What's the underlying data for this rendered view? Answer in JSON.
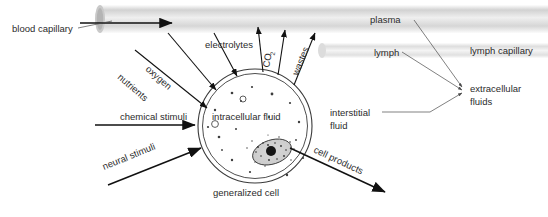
{
  "figure": {
    "background_color": "#ffffff",
    "text_color": "#2b2b2b",
    "arrow_color": "#111111",
    "leader_color": "#4a4a4a",
    "cell_fill_color": "#e3e3e3",
    "cell_outline_color": "#3a3a3a",
    "tube_color": "#d9d9d9"
  },
  "labels": {
    "blood_capillary": "blood capillary",
    "lymph_capillary": "lymph capillary",
    "plasma": "plasma",
    "lymph": "lymph",
    "extracellular_fluids_line1": "extracellular",
    "extracellular_fluids_line2": "fluids",
    "interstitial_fluid_line1": "interstitial",
    "interstitial_fluid_line2": "fluid",
    "intracellular_fluid": "intracellular fluid",
    "generalized_cell": "generalized cell",
    "oxygen": "oxygen",
    "nutrients": "nutrients",
    "electrolytes": "electrolytes",
    "co2_main": "CO",
    "co2_sub": "2",
    "wastes": "wastes",
    "chemical_stimuli": "chemical stimuli",
    "neural_stimuli": "neural stimuli",
    "cell_products": "cell products"
  },
  "flows": {
    "into_cell": [
      "oxygen",
      "nutrients",
      "electrolytes",
      "chemical stimuli",
      "neural stimuli"
    ],
    "out_of_cell": [
      "CO2",
      "wastes",
      "cell products"
    ]
  },
  "structures": {
    "cell_center_x": 255,
    "cell_center_y": 126,
    "cell_radius": 57,
    "nucleus_center_x": 272,
    "nucleus_center_y": 152,
    "nucleus_rx": 20,
    "nucleus_ry": 12,
    "nucleolus_radius": 5
  }
}
